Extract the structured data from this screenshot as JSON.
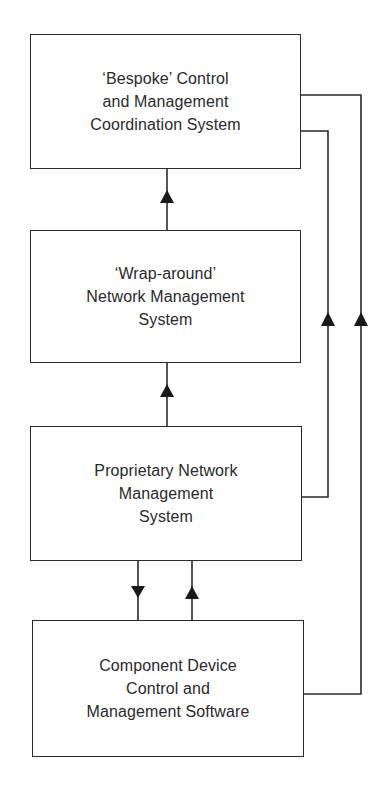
{
  "diagram": {
    "type": "block-flow",
    "nodes": [
      {
        "id": "bespoke",
        "label": "‘Bespoke’ Control\nand Management\nCoordination System"
      },
      {
        "id": "wraparound",
        "label": "‘Wrap-around’\nNetwork Management\nSystem"
      },
      {
        "id": "proprietary",
        "label": "Proprietary Network\nManagement\nSystem"
      },
      {
        "id": "component",
        "label": "Component Device\nControl and\nManagement Software"
      }
    ],
    "edges": [
      {
        "from": "wraparound",
        "to": "bespoke",
        "direction": "up"
      },
      {
        "from": "proprietary",
        "to": "wraparound",
        "direction": "up"
      },
      {
        "from": "proprietary",
        "to": "component",
        "direction": "down"
      },
      {
        "from": "component",
        "to": "proprietary",
        "direction": "up"
      },
      {
        "from": "proprietary",
        "to": "bespoke",
        "route": "right-side inner loop",
        "direction": "up"
      },
      {
        "from": "component",
        "to": "bespoke",
        "route": "right-side outer loop",
        "direction": "up"
      }
    ],
    "colors": {
      "stroke": "#2a2a2a",
      "background": "#ffffff"
    }
  }
}
